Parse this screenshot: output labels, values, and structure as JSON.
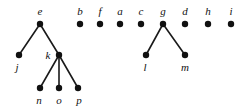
{
  "diagram": {
    "background_color": "#ffffff",
    "node_color": "#111111",
    "edge_color": "#1a1a1a",
    "node_radius": 3.2,
    "label_style": "italic-serif",
    "nodes": [
      {
        "id": "e",
        "label": "e",
        "x": 40,
        "y": 24,
        "label_x": 40,
        "label_y": 15,
        "label_pos": "above"
      },
      {
        "id": "b",
        "label": "b",
        "x": 80,
        "y": 24,
        "label_x": 80,
        "label_y": 15,
        "label_pos": "above"
      },
      {
        "id": "f",
        "label": "f",
        "x": 100,
        "y": 24,
        "label_x": 100,
        "label_y": 15,
        "label_pos": "above"
      },
      {
        "id": "a",
        "label": "a",
        "x": 120,
        "y": 24,
        "label_x": 120,
        "label_y": 15,
        "label_pos": "above"
      },
      {
        "id": "c",
        "label": "c",
        "x": 141,
        "y": 24,
        "label_x": 141,
        "label_y": 15,
        "label_pos": "above"
      },
      {
        "id": "g",
        "label": "g",
        "x": 163,
        "y": 24,
        "label_x": 163,
        "label_y": 15,
        "label_pos": "above"
      },
      {
        "id": "d",
        "label": "d",
        "x": 185,
        "y": 24,
        "label_x": 185,
        "label_y": 15,
        "label_pos": "above"
      },
      {
        "id": "h",
        "label": "h",
        "x": 208,
        "y": 24,
        "label_x": 208,
        "label_y": 15,
        "label_pos": "above"
      },
      {
        "id": "i",
        "label": "i",
        "x": 231,
        "y": 24,
        "label_x": 231,
        "label_y": 15,
        "label_pos": "above"
      },
      {
        "id": "j",
        "label": "j",
        "x": 19,
        "y": 55,
        "label_x": 17,
        "label_y": 71,
        "label_pos": "below"
      },
      {
        "id": "k",
        "label": "k",
        "x": 59,
        "y": 55,
        "label_x": 48,
        "label_y": 59,
        "label_pos": "left"
      },
      {
        "id": "l",
        "label": "l",
        "x": 146,
        "y": 55,
        "label_x": 145,
        "label_y": 71,
        "label_pos": "below"
      },
      {
        "id": "m",
        "label": "m",
        "x": 185,
        "y": 55,
        "label_x": 185,
        "label_y": 71,
        "label_pos": "below"
      },
      {
        "id": "n",
        "label": "n",
        "x": 40,
        "y": 88,
        "label_x": 39,
        "label_y": 104,
        "label_pos": "below"
      },
      {
        "id": "o",
        "label": "o",
        "x": 59,
        "y": 88,
        "label_x": 59,
        "label_y": 104,
        "label_pos": "below"
      },
      {
        "id": "p",
        "label": "p",
        "x": 78,
        "y": 88,
        "label_x": 79,
        "label_y": 104,
        "label_pos": "below"
      }
    ],
    "edges": [
      {
        "from": "e",
        "to": "j"
      },
      {
        "from": "e",
        "to": "k"
      },
      {
        "from": "k",
        "to": "n"
      },
      {
        "from": "k",
        "to": "o"
      },
      {
        "from": "k",
        "to": "p"
      },
      {
        "from": "g",
        "to": "l"
      },
      {
        "from": "g",
        "to": "m"
      }
    ],
    "isolated_nodes": [
      "b",
      "f",
      "a",
      "c",
      "d",
      "h",
      "i"
    ],
    "tree_roots": [
      "e",
      "g"
    ]
  }
}
